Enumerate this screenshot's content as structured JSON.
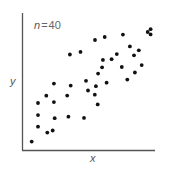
{
  "chart_data": {
    "type": "scatter",
    "title": "",
    "annotation": {
      "var": "n",
      "eq": "=",
      "value": "40"
    },
    "xlabel": "x",
    "ylabel": "y",
    "xlim": [
      0,
      10
    ],
    "ylim": [
      0,
      10
    ],
    "grid": false,
    "ticks": false,
    "legend": null,
    "colors": {
      "points": "#111111",
      "axes": "#555555",
      "labels": "#555555"
    },
    "series": [
      {
        "name": "observations",
        "points": [
          [
            0.73,
            0.61
          ],
          [
            1.2,
            1.7
          ],
          [
            1.2,
            2.55
          ],
          [
            1.2,
            3.43
          ],
          [
            1.9,
            1.27
          ],
          [
            1.83,
            3.96
          ],
          [
            2.31,
            1.42
          ],
          [
            2.46,
            2.32
          ],
          [
            2.4,
            3.5
          ],
          [
            2.4,
            4.85
          ],
          [
            3.4,
            3.97
          ],
          [
            3.49,
            2.43
          ],
          [
            3.66,
            4.7
          ],
          [
            3.6,
            6.97
          ],
          [
            4.66,
            2.34
          ],
          [
            4.4,
            7.16
          ],
          [
            4.96,
            4.34
          ],
          [
            4.81,
            5.05
          ],
          [
            5.47,
            4.04
          ],
          [
            5.69,
            3.33
          ],
          [
            6.02,
            6.04
          ],
          [
            5.56,
            4.66
          ],
          [
            5.72,
            5.58
          ],
          [
            6.36,
            4.91
          ],
          [
            6.08,
            6.58
          ],
          [
            6.22,
            8.25
          ],
          [
            5.49,
            8.03
          ],
          [
            6.74,
            6.63
          ],
          [
            7.13,
            7.0
          ],
          [
            7.59,
            8.42
          ],
          [
            7.5,
            6.06
          ],
          [
            8.11,
            7.56
          ],
          [
            7.92,
            5.14
          ],
          [
            8.49,
            5.66
          ],
          [
            8.78,
            7.28
          ],
          [
            8.42,
            6.91
          ],
          [
            9.0,
            6.2
          ],
          [
            9.45,
            8.61
          ],
          [
            9.67,
            8.44
          ],
          [
            9.67,
            8.82
          ]
        ]
      }
    ]
  }
}
